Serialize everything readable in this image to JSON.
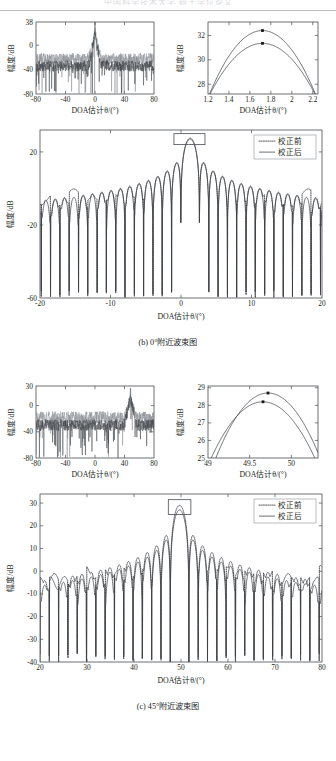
{
  "page": {
    "header_watermark": "中国科学技术大学 硕士学位论文",
    "background": "#ffffff",
    "ink": "#3c3f44"
  },
  "figures": [
    {
      "id": "fig-b",
      "caption": "(b) 0°附近波束图",
      "insets": [
        {
          "name": "wide-spectrum-0deg",
          "chart_data": {
            "type": "line",
            "title": "",
            "xlabel": "DOA估计θ/(°)",
            "ylabel": "幅度/dB",
            "xlim": [
              -80,
              80
            ],
            "ylim": [
              -80,
              38
            ],
            "xticks": [
              -80,
              -40,
              0,
              40,
              80
            ],
            "yticks": [
              -80,
              -40,
              0,
              38
            ],
            "grid": false,
            "legend": "none",
            "series": [
              {
                "name": "校正前",
                "style": "noise-light",
                "peak_x": 0,
                "peak_y": 30,
                "floor": -22
              },
              {
                "name": "校正后",
                "style": "noise-dark",
                "peak_x": 0,
                "peak_y": 33,
                "floor": -34
              }
            ]
          }
        },
        {
          "name": "zoom-peak-0deg",
          "chart_data": {
            "type": "line",
            "title": "",
            "xlabel": "DOA估计θ/(°)",
            "ylabel": "幅度/dB",
            "xlim": [
              1.2,
              2.25
            ],
            "ylim": [
              27.2,
              33.1
            ],
            "xticks": [
              1.2,
              1.4,
              1.6,
              1.8,
              2,
              2.2
            ],
            "xticklabels": [
              "1.2",
              "1.4",
              "1.6",
              "1.8",
              "2",
              "2.2"
            ],
            "yticks": [
              28,
              30,
              32
            ],
            "grid": false,
            "series": [
              {
                "name": "校正后",
                "peak_x": 1.72,
                "peak_y": 32.4,
                "marker": true
              },
              {
                "name": "校正前",
                "peak_x": 1.72,
                "peak_y": 31.35,
                "marker": true
              }
            ],
            "markers": [
              {
                "x": 1.72,
                "y": 32.4
              },
              {
                "x": 1.72,
                "y": 31.35
              }
            ]
          }
        }
      ],
      "main": {
        "name": "beampattern-near-0deg",
        "highlight_box": {
          "x_center": 1.2,
          "x_half_width": 2.2,
          "y_top": 30,
          "y_bottom": 24
        },
        "legend": {
          "position": "top-right",
          "entries": [
            {
              "label": "校正前",
              "style": "dotted"
            },
            {
              "label": "校正后",
              "style": "solid"
            }
          ]
        },
        "chart_data": {
          "type": "line",
          "title": "",
          "xlabel": "DOA估计θ/(°)",
          "ylabel": "幅度/dB",
          "xlim": [
            -20,
            20
          ],
          "ylim": [
            -60,
            32
          ],
          "xticks": [
            -20,
            -10,
            0,
            10,
            20
          ],
          "yticks": [
            -60,
            -20,
            20
          ],
          "grid": false,
          "series": [
            {
              "name": "校正前",
              "style": "dotted",
              "mainlobe_x": 1.3,
              "mainlobe_y": 27.5,
              "sidelobe_level": -11
            },
            {
              "name": "校正后",
              "style": "solid",
              "mainlobe_x": 1.3,
              "mainlobe_y": 27.0,
              "sidelobe_level": -19
            }
          ]
        }
      }
    },
    {
      "id": "fig-c",
      "caption": "(c) 45°附近波束图",
      "insets": [
        {
          "name": "wide-spectrum-45deg",
          "chart_data": {
            "type": "line",
            "title": "",
            "xlabel": "DOA估计θ/(°)",
            "ylabel": "幅度/dB",
            "xlim": [
              -80,
              80
            ],
            "ylim": [
              -80,
              30
            ],
            "xticks": [
              -80,
              -40,
              0,
              40,
              80
            ],
            "yticks": [
              -80,
              -40,
              0,
              30
            ],
            "grid": false,
            "series": [
              {
                "name": "校正前",
                "style": "noise-light",
                "peak_x": 48,
                "peak_y": 18,
                "floor": -18
              },
              {
                "name": "校正后",
                "style": "noise-dark",
                "peak_x": 48,
                "peak_y": 28,
                "floor": -30
              }
            ]
          }
        },
        {
          "name": "zoom-peak-45deg",
          "chart_data": {
            "type": "line",
            "title": "",
            "xlabel": "DOA估计θ/(°)",
            "ylabel": "幅度/dB",
            "xlim": [
              49,
              50.32
            ],
            "ylim": [
              25,
              29.1
            ],
            "xticks": [
              49,
              49.5,
              50
            ],
            "xticklabels": [
              "49",
              "49.5",
              "50"
            ],
            "yticks": [
              25,
              26,
              27,
              28,
              29
            ],
            "grid": false,
            "series": [
              {
                "name": "校正后",
                "peak_x": 49.72,
                "peak_y": 28.7,
                "marker": true
              },
              {
                "name": "校正前",
                "peak_x": 49.66,
                "peak_y": 28.2,
                "marker": true
              }
            ],
            "markers": [
              {
                "x": 49.72,
                "y": 28.7
              },
              {
                "x": 49.66,
                "y": 28.2
              }
            ]
          }
        }
      ],
      "main": {
        "name": "beampattern-near-45deg",
        "highlight_box": {
          "x_center": 49.7,
          "x_half_width": 2.4,
          "y_top": 31.5,
          "y_bottom": 25
        },
        "legend": {
          "position": "top-right",
          "entries": [
            {
              "label": "校正前",
              "style": "dotted"
            },
            {
              "label": "校正后",
              "style": "solid"
            }
          ]
        },
        "chart_data": {
          "type": "line",
          "title": "",
          "xlabel": "DOA估计θ/(°)",
          "ylabel": "幅度/dB",
          "xlim": [
            20,
            80
          ],
          "ylim": [
            -40,
            34
          ],
          "xticks": [
            20,
            30,
            40,
            50,
            60,
            70,
            80
          ],
          "yticks": [
            -40,
            -30,
            -20,
            -10,
            0,
            10,
            20,
            30
          ],
          "grid": false,
          "series": [
            {
              "name": "校正前",
              "style": "dotted",
              "mainlobe_x": 49.7,
              "mainlobe_y": 29.0,
              "sidelobe_level": -7
            },
            {
              "name": "校正后",
              "style": "solid",
              "mainlobe_x": 49.7,
              "mainlobe_y": 27.0,
              "sidelobe_level": -13
            }
          ]
        }
      }
    }
  ]
}
